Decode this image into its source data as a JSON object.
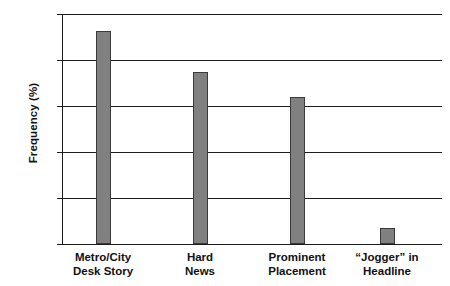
{
  "chart_data": {
    "type": "bar",
    "title": "",
    "xlabel": "",
    "ylabel": "Frequency (%)",
    "ylim": [
      0,
      100
    ],
    "ytick_labels": [
      "100",
      "80",
      "60",
      "40",
      "20",
      "0"
    ],
    "ytick_values": [
      100,
      80,
      60,
      40,
      20,
      0
    ],
    "grid": true,
    "legend": "none",
    "bar_color": "#808080",
    "bar_edge_color": "#3a3a3a",
    "axis_color": "#1c1c1c",
    "background": "#ffffff",
    "categories": [
      "Metro/City Desk Story",
      "Hard News",
      "Prominent Placement",
      "“Jogger” in Headline"
    ],
    "category_lines": [
      {
        "line1": "Metro/City",
        "line2": "Desk Story"
      },
      {
        "line1": "Hard",
        "line2": "News"
      },
      {
        "line1": "Prominent",
        "line2": "Placement"
      },
      {
        "line1": "“Jogger” in",
        "line2": "Headline"
      }
    ],
    "values": [
      92.5,
      75,
      64,
      7
    ]
  }
}
